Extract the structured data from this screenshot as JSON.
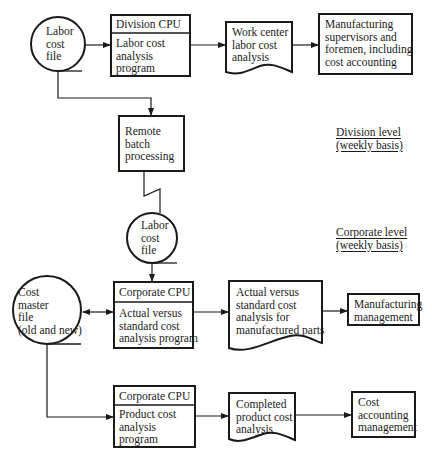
{
  "diagram": {
    "type": "system-flowchart",
    "levels": [
      {
        "id": "division",
        "label_line1": "Division level",
        "label_line2": "(weekly basis)"
      },
      {
        "id": "corporate",
        "label_line1": "Corporate level",
        "label_line2": "(weekly basis)"
      }
    ],
    "nodes": {
      "labor_file_1": {
        "shape": "online-storage",
        "lines": [
          "Labor",
          "cost",
          "file"
        ]
      },
      "division_cpu": {
        "shape": "process",
        "header": "Division CPU",
        "lines": [
          "Labor cost",
          "analysis",
          "program"
        ]
      },
      "work_center_report": {
        "shape": "document",
        "lines": [
          "Work center",
          "labor cost",
          "analysis"
        ]
      },
      "mfg_supervisors": {
        "shape": "process",
        "lines": [
          "Manufacturing",
          "supervisors and",
          "foremen, including",
          "cost accounting"
        ]
      },
      "remote_batch": {
        "shape": "process",
        "lines": [
          "Remote",
          "batch",
          "processing"
        ]
      },
      "labor_file_2": {
        "shape": "online-storage",
        "lines": [
          "Labor",
          "cost",
          "file"
        ]
      },
      "cost_master": {
        "shape": "online-storage",
        "lines": [
          "Cost",
          "master",
          "file",
          "(old and new)"
        ]
      },
      "corporate_cpu_1": {
        "shape": "process",
        "header": "Corporate CPU",
        "lines": [
          "Actual versus",
          "standard cost",
          "analysis program"
        ]
      },
      "actual_vs_std_report": {
        "shape": "document",
        "lines": [
          "Actual versus",
          "standard cost",
          "analysis for",
          "manufactured parts"
        ]
      },
      "mfg_management": {
        "shape": "process",
        "lines": [
          "Manufacturing",
          "management"
        ]
      },
      "corporate_cpu_2": {
        "shape": "process",
        "header": "Corporate CPU",
        "lines": [
          "Product cost",
          "analysis",
          "program"
        ]
      },
      "completed_report": {
        "shape": "document",
        "lines": [
          "Completed",
          "product cost",
          "analysis"
        ]
      },
      "cost_acct_mgmt": {
        "shape": "process",
        "lines": [
          "Cost",
          "accounting",
          "management"
        ]
      }
    },
    "edges": [
      {
        "from": "labor_file_1",
        "to": "division_cpu"
      },
      {
        "from": "division_cpu",
        "to": "work_center_report"
      },
      {
        "from": "work_center_report",
        "to": "mfg_supervisors"
      },
      {
        "from": "labor_file_1",
        "to": "remote_batch"
      },
      {
        "from": "remote_batch",
        "to": "labor_file_2",
        "style": "communication-link"
      },
      {
        "from": "labor_file_2",
        "to": "corporate_cpu_1"
      },
      {
        "from": "cost_master",
        "to": "corporate_cpu_1",
        "bidirectional": true
      },
      {
        "from": "corporate_cpu_1",
        "to": "actual_vs_std_report"
      },
      {
        "from": "actual_vs_std_report",
        "to": "mfg_management"
      },
      {
        "from": "cost_master",
        "to": "corporate_cpu_2"
      },
      {
        "from": "corporate_cpu_2",
        "to": "completed_report"
      },
      {
        "from": "completed_report",
        "to": "cost_acct_mgmt"
      }
    ],
    "colors": {
      "ink": "#1a1a1a",
      "background": "#ffffff"
    }
  }
}
